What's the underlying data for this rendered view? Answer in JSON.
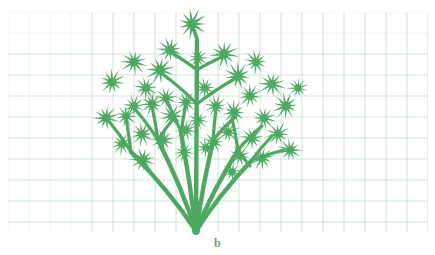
{
  "figure": {
    "kind": "botanical-line-illustration",
    "caption": "b",
    "caption_color": "#63a86f",
    "background_color": "#ffffff"
  },
  "grid": {
    "name": "graph-paper-grid",
    "line_color": "#b9d9bd",
    "line_color_faint": "#d8ebda",
    "cell_size_px": 21,
    "origin_x": 8,
    "origin_y": 12,
    "width": 420,
    "height": 220,
    "columns": 20,
    "rows": 10,
    "line_width": 0.8,
    "visible": true
  },
  "plant": {
    "name": "umbel-plant-silhouette",
    "ink_color": "#4ea862",
    "stroke_color": "#4ea862",
    "base_x": 196,
    "base_y": 231,
    "stem_top_y": 30,
    "main_stem_width": 5.2,
    "ray_width_primary": 4.4,
    "ray_width_secondary": 3.2,
    "ray_width_tertiary": 2.4,
    "flower": {
      "name": "star-floret-head",
      "points": 11,
      "inner_ratio": 0.3,
      "radius_large": 15,
      "radius_medium": 12,
      "radius_small": 9.5
    },
    "branches": [
      {
        "id": "ray-left-outer",
        "x1": 196,
        "y1": 231,
        "x2": 131,
        "y2": 152
      },
      {
        "id": "ray-left-mid",
        "x1": 196,
        "y1": 231,
        "x2": 158,
        "y2": 140
      },
      {
        "id": "ray-left-inner",
        "x1": 196,
        "y1": 231,
        "x2": 181,
        "y2": 132
      },
      {
        "id": "ray-center",
        "x1": 196,
        "y1": 231,
        "x2": 197,
        "y2": 40
      },
      {
        "id": "ray-right-inner",
        "x1": 196,
        "y1": 231,
        "x2": 213,
        "y2": 140
      },
      {
        "id": "ray-right-mid",
        "x1": 196,
        "y1": 231,
        "x2": 238,
        "y2": 150
      },
      {
        "id": "ray-right-outer",
        "x1": 196,
        "y1": 231,
        "x2": 252,
        "y2": 160
      }
    ],
    "secondary_branches": [
      {
        "id": "sec-l1",
        "x1": 131,
        "y1": 152,
        "x2": 108,
        "y2": 120
      },
      {
        "id": "sec-l2",
        "x1": 131,
        "y1": 152,
        "x2": 126,
        "y2": 118
      },
      {
        "id": "sec-l3",
        "x1": 131,
        "y1": 152,
        "x2": 142,
        "y2": 160
      },
      {
        "id": "sec-l4",
        "x1": 158,
        "y1": 140,
        "x2": 134,
        "y2": 108
      },
      {
        "id": "sec-l5",
        "x1": 158,
        "y1": 140,
        "x2": 152,
        "y2": 106
      },
      {
        "id": "sec-l6",
        "x1": 158,
        "y1": 140,
        "x2": 174,
        "y2": 118
      },
      {
        "id": "sec-l7",
        "x1": 181,
        "y1": 132,
        "x2": 166,
        "y2": 100
      },
      {
        "id": "sec-l8",
        "x1": 181,
        "y1": 132,
        "x2": 186,
        "y2": 104
      },
      {
        "id": "sec-c1",
        "x1": 197,
        "y1": 104,
        "x2": 160,
        "y2": 72
      },
      {
        "id": "sec-c2",
        "x1": 197,
        "y1": 104,
        "x2": 236,
        "y2": 78
      },
      {
        "id": "sec-c3",
        "x1": 197,
        "y1": 70,
        "x2": 170,
        "y2": 52
      },
      {
        "id": "sec-c4",
        "x1": 197,
        "y1": 70,
        "x2": 224,
        "y2": 56
      },
      {
        "id": "sec-c5",
        "x1": 197,
        "y1": 40,
        "x2": 192,
        "y2": 26
      },
      {
        "id": "sec-r1",
        "x1": 213,
        "y1": 140,
        "x2": 216,
        "y2": 108
      },
      {
        "id": "sec-r2",
        "x1": 213,
        "y1": 140,
        "x2": 236,
        "y2": 116
      },
      {
        "id": "sec-r3",
        "x1": 238,
        "y1": 150,
        "x2": 232,
        "y2": 118
      },
      {
        "id": "sec-r4",
        "x1": 238,
        "y1": 150,
        "x2": 262,
        "y2": 126
      },
      {
        "id": "sec-r5",
        "x1": 238,
        "y1": 150,
        "x2": 250,
        "y2": 166
      },
      {
        "id": "sec-r6",
        "x1": 252,
        "y1": 160,
        "x2": 272,
        "y2": 136
      },
      {
        "id": "sec-r7",
        "x1": 252,
        "y1": 160,
        "x2": 284,
        "y2": 150
      }
    ],
    "florets": [
      {
        "id": "f-top",
        "cx": 192,
        "cy": 24,
        "r": 15
      },
      {
        "id": "f-t2",
        "cx": 170,
        "cy": 50,
        "r": 13
      },
      {
        "id": "f-t3",
        "cx": 224,
        "cy": 54,
        "r": 14
      },
      {
        "id": "f-t4",
        "cx": 198,
        "cy": 58,
        "r": 10
      },
      {
        "id": "f-c1",
        "cx": 160,
        "cy": 70,
        "r": 14
      },
      {
        "id": "f-c2",
        "cx": 238,
        "cy": 76,
        "r": 14
      },
      {
        "id": "f-c3",
        "cx": 205,
        "cy": 88,
        "r": 11
      },
      {
        "id": "f-l1",
        "cx": 134,
        "cy": 62,
        "r": 13
      },
      {
        "id": "f-l2",
        "cx": 112,
        "cy": 82,
        "r": 13
      },
      {
        "id": "f-l3",
        "cx": 146,
        "cy": 88,
        "r": 12
      },
      {
        "id": "f-l4",
        "cx": 106,
        "cy": 118,
        "r": 13
      },
      {
        "id": "f-l5",
        "cx": 126,
        "cy": 116,
        "r": 11
      },
      {
        "id": "f-l6",
        "cx": 134,
        "cy": 106,
        "r": 11
      },
      {
        "id": "f-l7",
        "cx": 152,
        "cy": 104,
        "r": 12
      },
      {
        "id": "f-l8",
        "cx": 172,
        "cy": 116,
        "r": 12
      },
      {
        "id": "f-l9",
        "cx": 166,
        "cy": 98,
        "r": 11
      },
      {
        "id": "f-l10",
        "cx": 186,
        "cy": 102,
        "r": 11
      },
      {
        "id": "f-l11",
        "cx": 142,
        "cy": 134,
        "r": 12
      },
      {
        "id": "f-l12",
        "cx": 163,
        "cy": 140,
        "r": 12
      },
      {
        "id": "f-l13",
        "cx": 186,
        "cy": 130,
        "r": 11
      },
      {
        "id": "f-l14",
        "cx": 122,
        "cy": 144,
        "r": 11
      },
      {
        "id": "f-l15",
        "cx": 143,
        "cy": 160,
        "r": 13
      },
      {
        "id": "f-l16",
        "cx": 184,
        "cy": 152,
        "r": 10
      },
      {
        "id": "f-r1",
        "cx": 256,
        "cy": 62,
        "r": 12
      },
      {
        "id": "f-r2",
        "cx": 272,
        "cy": 84,
        "r": 13
      },
      {
        "id": "f-r3",
        "cx": 250,
        "cy": 96,
        "r": 12
      },
      {
        "id": "f-r4",
        "cx": 286,
        "cy": 106,
        "r": 13
      },
      {
        "id": "f-r5",
        "cx": 264,
        "cy": 118,
        "r": 12
      },
      {
        "id": "f-r6",
        "cx": 234,
        "cy": 112,
        "r": 12
      },
      {
        "id": "f-r7",
        "cx": 216,
        "cy": 106,
        "r": 11
      },
      {
        "id": "f-r8",
        "cx": 298,
        "cy": 88,
        "r": 10
      },
      {
        "id": "f-r9",
        "cx": 278,
        "cy": 134,
        "r": 12
      },
      {
        "id": "f-r10",
        "cx": 252,
        "cy": 138,
        "r": 12
      },
      {
        "id": "f-r11",
        "cx": 228,
        "cy": 132,
        "r": 11
      },
      {
        "id": "f-r12",
        "cx": 290,
        "cy": 150,
        "r": 12
      },
      {
        "id": "f-r13",
        "cx": 262,
        "cy": 158,
        "r": 12
      },
      {
        "id": "f-r14",
        "cx": 240,
        "cy": 156,
        "r": 11
      },
      {
        "id": "f-r15",
        "cx": 214,
        "cy": 142,
        "r": 11
      },
      {
        "id": "f-r16",
        "cx": 232,
        "cy": 172,
        "r": 10
      },
      {
        "id": "f-m1",
        "cx": 198,
        "cy": 120,
        "r": 10
      },
      {
        "id": "f-m2",
        "cx": 206,
        "cy": 148,
        "r": 10
      }
    ]
  }
}
